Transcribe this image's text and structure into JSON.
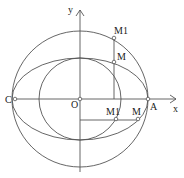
{
  "diagram": {
    "axes": {
      "x_label": "x",
      "y_label": "y"
    },
    "points": {
      "origin": "O",
      "left": "C",
      "right": "A",
      "upper_outer": "M1",
      "upper_ellipse": "M",
      "lower_inner": "M1",
      "lower_ellipse": "M"
    },
    "stroke_color": "#555555"
  }
}
